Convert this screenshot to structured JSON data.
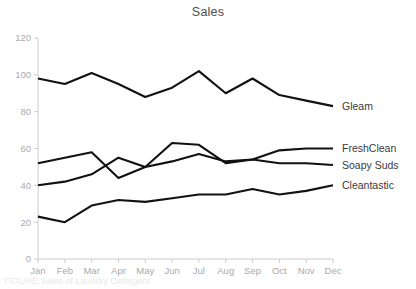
{
  "chart_data": {
    "type": "line",
    "title": "Sales",
    "xlabel": "",
    "ylabel": "",
    "categories": [
      "Jan",
      "Feb",
      "Mar",
      "Apr",
      "May",
      "Jun",
      "Jul",
      "Aug",
      "Sep",
      "Oct",
      "Nov",
      "Dec"
    ],
    "ylim": [
      0,
      120
    ],
    "yticks": [
      0,
      20,
      40,
      60,
      80,
      100,
      120
    ],
    "grid": false,
    "legend": "direct-label-right",
    "line_color": "#111111",
    "axis_color": "#cccccc",
    "tick_label_color": "#aaaaaa",
    "title_color": "#4d4d4d",
    "series": [
      {
        "name": "Gleam",
        "values": [
          98,
          95,
          101,
          95,
          88,
          93,
          102,
          90,
          98,
          89,
          86,
          83
        ]
      },
      {
        "name": "FreshClean",
        "values": [
          52,
          55,
          58,
          44,
          50,
          63,
          62,
          52,
          54,
          59,
          60,
          60
        ]
      },
      {
        "name": "Soapy Suds",
        "values": [
          40,
          42,
          46,
          55,
          50,
          53,
          57,
          53,
          54,
          52,
          52,
          51
        ]
      },
      {
        "name": "Cleantastic",
        "values": [
          23,
          20,
          29,
          32,
          31,
          33,
          35,
          35,
          38,
          35,
          37,
          40
        ]
      }
    ]
  },
  "footer": {
    "caption": "FIGURE Sales of Laundry Detergent"
  }
}
